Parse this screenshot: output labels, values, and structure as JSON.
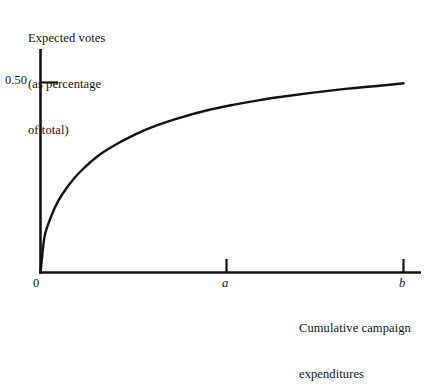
{
  "figure": {
    "background_color": "#ffffff",
    "ink_color": "#111111",
    "y_axis_title_lines": [
      "Expected votes",
      "(as percentage",
      "of total)"
    ],
    "x_axis_title_lines": [
      "Cumulative campaign",
      "expenditures"
    ],
    "origin_label": "0",
    "y_tick_label": "0.50",
    "x_tick_labels": [
      "a",
      "b"
    ]
  },
  "chart_data": {
    "type": "line",
    "title": "",
    "xlabel": "Cumulative campaign expenditures",
    "ylabel": "Expected votes (as percentage of total)",
    "grid": false,
    "legend": false,
    "xlim": [
      0,
      1.12
    ],
    "ylim": [
      0,
      0.56
    ],
    "x_ticks": [
      0,
      0.5,
      1.0
    ],
    "x_tick_labels": [
      "0",
      "a",
      "b"
    ],
    "y_ticks": [
      0.5
    ],
    "y_tick_labels": [
      "0.50"
    ],
    "series": [
      {
        "name": "Expected votes",
        "x": [
          0.0,
          0.01,
          0.02,
          0.04,
          0.06,
          0.09,
          0.12,
          0.16,
          0.21,
          0.26,
          0.32,
          0.39,
          0.46,
          0.53,
          0.6,
          0.67,
          0.74,
          0.81,
          0.88,
          0.94,
          1.0
        ],
        "y": [
          0.0,
          0.088,
          0.124,
          0.172,
          0.206,
          0.245,
          0.275,
          0.308,
          0.338,
          0.363,
          0.387,
          0.409,
          0.427,
          0.441,
          0.453,
          0.463,
          0.472,
          0.48,
          0.487,
          0.492,
          0.498
        ]
      }
    ]
  }
}
